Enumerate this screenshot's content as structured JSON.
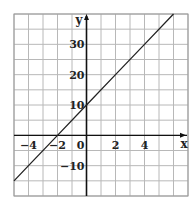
{
  "chart_data": {
    "type": "line",
    "title": "",
    "xlabel": "x",
    "ylabel": "y",
    "xlim": [
      -5,
      7
    ],
    "ylim": [
      -20,
      40
    ],
    "grid": true,
    "x_ticks": [
      -4,
      -2,
      0,
      2,
      4
    ],
    "y_ticks": [
      -10,
      10,
      20,
      30
    ],
    "x_tick_labels": [
      "−4",
      "−2",
      "0",
      "2",
      "4"
    ],
    "y_tick_labels": [
      "−10",
      "10",
      "20",
      "30"
    ],
    "series": [
      {
        "name": "y = 5x + 10",
        "x": [
          -5,
          -4,
          -2,
          0,
          2,
          4,
          6
        ],
        "y": [
          -15,
          -10,
          0,
          10,
          20,
          30,
          40
        ]
      }
    ],
    "colors": {
      "line": "#222222",
      "grid": "#b8b8b8",
      "axis": "#111111"
    }
  }
}
